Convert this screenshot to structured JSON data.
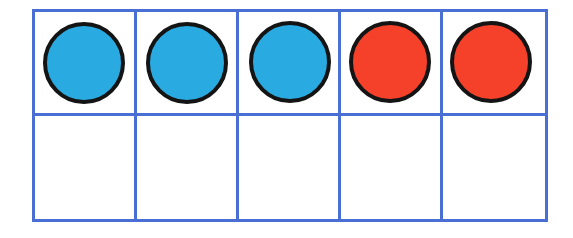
{
  "activity": {
    "name": "ten-frame",
    "rows": 2,
    "columns": 5,
    "total_slots": 10,
    "filled_count": 5,
    "empty_count": 5
  },
  "colors": {
    "grid_line": "#4a6fd4",
    "counter_blue": "#29ABE2",
    "counter_red": "#F5402A",
    "counter_outline": "#141414",
    "cell_fill": "#ffffff",
    "background": "#ffffff"
  },
  "counts": {
    "blue": 3,
    "red": 2
  },
  "cells": [
    {
      "id": "cell-r1c1",
      "row": 1,
      "column": 1,
      "filled": true,
      "counter_color": "blue",
      "label": ""
    },
    {
      "id": "cell-r1c2",
      "row": 1,
      "column": 2,
      "filled": true,
      "counter_color": "blue",
      "label": ""
    },
    {
      "id": "cell-r1c3",
      "row": 1,
      "column": 3,
      "filled": true,
      "counter_color": "blue",
      "label": ""
    },
    {
      "id": "cell-r1c4",
      "row": 1,
      "column": 4,
      "filled": true,
      "counter_color": "red",
      "label": ""
    },
    {
      "id": "cell-r1c5",
      "row": 1,
      "column": 5,
      "filled": true,
      "counter_color": "red",
      "label": ""
    },
    {
      "id": "cell-r2c1",
      "row": 2,
      "column": 1,
      "filled": false,
      "counter_color": null,
      "label": ""
    },
    {
      "id": "cell-r2c2",
      "row": 2,
      "column": 2,
      "filled": false,
      "counter_color": null,
      "label": ""
    },
    {
      "id": "cell-r2c3",
      "row": 2,
      "column": 3,
      "filled": false,
      "counter_color": null,
      "label": ""
    },
    {
      "id": "cell-r2c4",
      "row": 2,
      "column": 4,
      "filled": false,
      "counter_color": null,
      "label": ""
    },
    {
      "id": "cell-r2c5",
      "row": 2,
      "column": 5,
      "filled": false,
      "counter_color": null,
      "label": ""
    }
  ]
}
